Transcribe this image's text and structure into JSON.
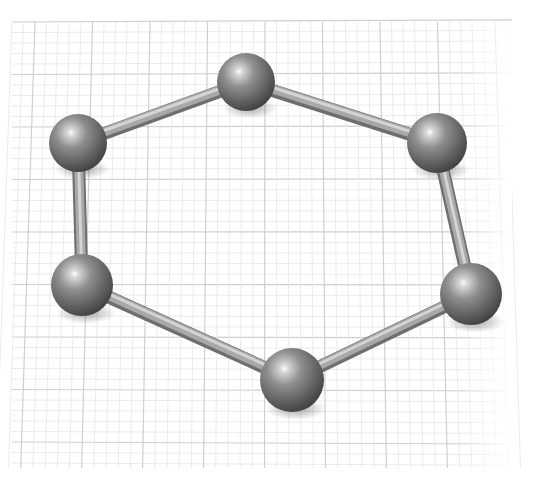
{
  "scene": {
    "description": "3D ball-and-stick model of a six-membered ring on a grid plane",
    "background_color": "#ffffff",
    "grid": {
      "x0": 12,
      "y0": 22,
      "x1": 512,
      "y1": 468,
      "minor_color": "#e6e6e6",
      "major_color": "#cfcfcf"
    },
    "atom_color": "#7a7a7a",
    "bond_color": "#a8a8a8",
    "atoms": [
      {
        "id": "top",
        "x": 246,
        "y": 82,
        "r": 29
      },
      {
        "id": "upper-right",
        "x": 437,
        "y": 143,
        "r": 30
      },
      {
        "id": "lower-right",
        "x": 471,
        "y": 294,
        "r": 31
      },
      {
        "id": "bottom",
        "x": 292,
        "y": 380,
        "r": 32
      },
      {
        "id": "lower-left",
        "x": 82,
        "y": 285,
        "r": 31
      },
      {
        "id": "upper-left",
        "x": 78,
        "y": 143,
        "r": 29
      }
    ],
    "bonds": [
      [
        0,
        1
      ],
      [
        1,
        2
      ],
      [
        2,
        3
      ],
      [
        3,
        4
      ],
      [
        4,
        5
      ],
      [
        5,
        0
      ]
    ]
  }
}
